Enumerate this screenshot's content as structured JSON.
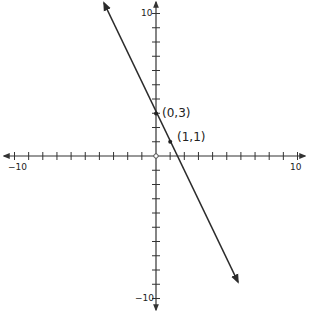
{
  "chart_data": {
    "type": "line",
    "title": "",
    "xlabel": "",
    "ylabel": "",
    "xlim": [
      -10,
      10
    ],
    "ylim": [
      -10,
      10
    ],
    "grid": false,
    "tick_step": 1,
    "tick_labels": {
      "x_min": "−10",
      "x_max": "10",
      "y_min": "−10",
      "y_max": "10"
    },
    "series": [
      {
        "name": "y = -2x + 3",
        "slope": -2,
        "intercept": 3,
        "x": [
          -3.65,
          5.8
        ],
        "y": [
          10.3,
          -8.6
        ],
        "arrows_both_ends": true
      }
    ],
    "points": [
      {
        "x": 0,
        "y": 3,
        "label": "(0,3)"
      },
      {
        "x": 1,
        "y": 1,
        "label": "(1,1)"
      }
    ],
    "colors": {
      "axis": "#333333",
      "line": "#2b2b2b",
      "text": "#222222"
    }
  }
}
